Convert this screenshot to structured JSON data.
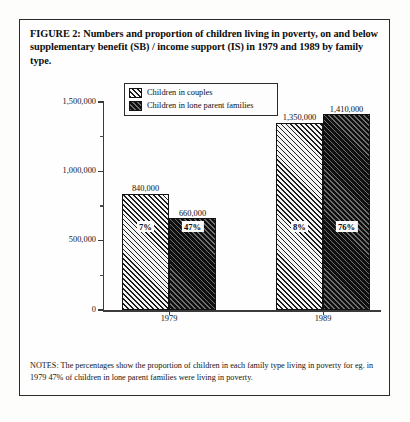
{
  "figure": {
    "title": "FIGURE 2: Numbers and proportion of children living in poverty, on and below supplementary benefit (SB) / income support (IS) in 1979 and 1989 by family type.",
    "notes": "NOTES: The percentages show the proportion of children in each family type living in poverty for eg. in 1979 47% of children in lone parent families were living in poverty."
  },
  "legend": {
    "items": [
      {
        "label": "Children in couples",
        "swatch": "hatched-diagonal-light"
      },
      {
        "label": "Children in lone parent families",
        "swatch": "hatched-diagonal-dark"
      }
    ]
  },
  "axis": {
    "y_ticks_major": [
      "1,500,000",
      "1,000,000",
      "500,000",
      "0"
    ],
    "x_ticks": [
      "1979",
      "1989"
    ]
  },
  "chart_data": {
    "type": "bar",
    "title": "FIGURE 2: Numbers and proportion of children living in poverty, on and below supplementary benefit (SB) / income support (IS) in 1979 and 1989 by family type.",
    "xlabel": "",
    "ylabel": "",
    "ylim": [
      0,
      1500000
    ],
    "ytick_values": [
      0,
      500000,
      1000000,
      1500000
    ],
    "ytick_labels": [
      "0",
      "500,000",
      "1,000,000",
      "1,500,000"
    ],
    "yminor_tick_values": [
      250000,
      750000,
      1250000
    ],
    "grid": false,
    "legend_position": "top-center",
    "categories": [
      "1979",
      "1989"
    ],
    "series": [
      {
        "name": "Children in couples",
        "values": [
          840000,
          1350000
        ],
        "value_labels": [
          "840,000",
          "1,350,000"
        ],
        "percent_labels": [
          "7%",
          "8%"
        ]
      },
      {
        "name": "Children in lone parent families",
        "values": [
          660000,
          1410000
        ],
        "value_labels": [
          "660,000",
          "1,410,000"
        ],
        "percent_labels": [
          "47%",
          "76%"
        ]
      }
    ]
  }
}
